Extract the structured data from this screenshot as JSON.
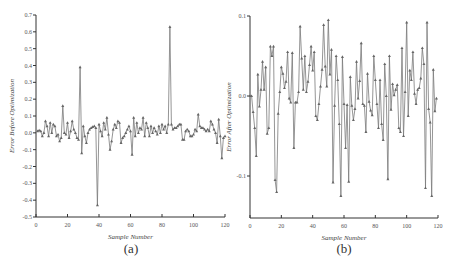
{
  "chart_data": [
    {
      "id": "a",
      "type": "line",
      "caption": "(a)",
      "title": "",
      "xlabel": "Sample Number",
      "ylabel": "Error Before Optimization",
      "xlim": [
        0,
        120
      ],
      "ylim": [
        -0.5,
        0.7
      ],
      "xticks": [
        0,
        20,
        40,
        60,
        80,
        100,
        120
      ],
      "yticks": [
        -0.5,
        -0.4,
        -0.3,
        -0.2,
        -0.1,
        0.0,
        0.1,
        0.2,
        0.3,
        0.4,
        0.5,
        0.6,
        0.7
      ],
      "ytick_labels": [
        "-0.5",
        "-0.4",
        "-0.3",
        "-0.2",
        "-0.1",
        "0.0",
        "0.1",
        "0.2",
        "0.3",
        "0.4",
        "0.5",
        "0.6",
        "0.7"
      ],
      "grid": false,
      "marker": "triangle",
      "x": [
        1,
        2,
        3,
        4,
        5,
        6,
        7,
        8,
        9,
        10,
        11,
        12,
        13,
        14,
        15,
        16,
        17,
        18,
        19,
        20,
        21,
        22,
        23,
        24,
        25,
        26,
        27,
        28,
        29,
        30,
        31,
        32,
        33,
        34,
        35,
        36,
        37,
        38,
        39,
        40,
        41,
        42,
        43,
        44,
        45,
        46,
        47,
        48,
        49,
        50,
        51,
        52,
        53,
        54,
        55,
        56,
        57,
        58,
        59,
        60,
        61,
        62,
        63,
        64,
        65,
        66,
        67,
        68,
        69,
        70,
        71,
        72,
        73,
        74,
        75,
        76,
        77,
        78,
        79,
        80,
        81,
        82,
        83,
        84,
        85,
        86,
        87,
        88,
        89,
        90,
        91,
        92,
        93,
        94,
        95,
        96,
        97,
        98,
        99,
        100,
        101,
        102,
        103,
        104,
        105,
        106,
        107,
        108,
        109,
        110,
        111,
        112,
        113,
        114,
        115,
        116,
        117,
        118,
        119,
        120
      ],
      "values": [
        0.01,
        0.015,
        0.01,
        -0.02,
        0.0,
        0.07,
        0.04,
        -0.02,
        0.06,
        0.0,
        0.05,
        0.04,
        -0.02,
        -0.01,
        -0.05,
        -0.03,
        0.16,
        0.0,
        -0.01,
        0.06,
        -0.03,
        0.01,
        0.07,
        0.02,
        0.0,
        -0.03,
        -0.04,
        0.39,
        -0.12,
        0.04,
        -0.02,
        -0.06,
        0.0,
        0.02,
        0.03,
        0.035,
        0.04,
        0.03,
        -0.43,
        0.05,
        0.01,
        -0.02,
        0.06,
        0.02,
        0.09,
        -0.01,
        -0.1,
        -0.05,
        0.02,
        0.05,
        0.03,
        0.07,
        0.06,
        -0.06,
        -0.03,
        -0.02,
        0.0,
        0.02,
        0.04,
        0.01,
        -0.13,
        0.09,
        -0.02,
        0.06,
        0.0,
        0.03,
        0.02,
        0.09,
        -0.02,
        0.06,
        0.03,
        -0.02,
        0.04,
        0.0,
        0.03,
        0.01,
        -0.01,
        0.04,
        0.0,
        0.05,
        0.02,
        0.04,
        0.0,
        0.05,
        0.63,
        0.05,
        0.02,
        0.03,
        0.03,
        0.04,
        0.05,
        0.05,
        -0.04,
        -0.04,
        0.01,
        0.02,
        0.01,
        -0.02,
        -0.02,
        -0.01,
        0.02,
        0.01,
        0.11,
        0.04,
        0.03,
        0.03,
        0.02,
        0.01,
        0.02,
        0.01,
        0.07,
        0.05,
        0.02,
        0.0,
        -0.06,
        0.08,
        -0.02,
        -0.15,
        -0.03,
        -0.02
      ]
    },
    {
      "id": "b",
      "type": "line",
      "caption": "(b)",
      "title": "",
      "xlabel": "Sample Number",
      "ylabel": "Error After Optimization",
      "xlim": [
        0,
        120
      ],
      "ylim": [
        -0.15,
        0.1
      ],
      "xticks": [
        0,
        20,
        40,
        60,
        80,
        100,
        120
      ],
      "yticks": [
        -0.1,
        0.0,
        0.1
      ],
      "ytick_labels": [
        "-0.1",
        "0.0",
        "0.1"
      ],
      "grid": false,
      "marker": "triangle",
      "x": [
        0,
        1,
        2,
        3,
        4,
        5,
        6,
        7,
        8,
        9,
        10,
        11,
        12,
        13,
        14,
        15,
        16,
        17,
        18,
        19,
        20,
        21,
        22,
        23,
        24,
        25,
        26,
        27,
        28,
        29,
        30,
        31,
        32,
        33,
        34,
        35,
        36,
        37,
        38,
        39,
        40,
        41,
        42,
        43,
        44,
        45,
        46,
        47,
        48,
        49,
        50,
        51,
        52,
        53,
        54,
        55,
        56,
        57,
        58,
        59,
        60,
        61,
        62,
        63,
        64,
        65,
        66,
        67,
        68,
        69,
        70,
        71,
        72,
        73,
        74,
        75,
        76,
        77,
        78,
        79,
        80,
        81,
        82,
        83,
        84,
        85,
        86,
        87,
        88,
        89,
        90,
        91,
        92,
        93,
        94,
        95,
        96,
        97,
        98,
        99,
        100,
        101,
        102,
        103,
        104,
        105,
        106,
        107,
        108,
        109,
        110,
        111,
        112,
        113,
        114,
        115,
        116,
        117,
        118,
        119
      ],
      "values": [
        0.0,
        0.0,
        -0.02,
        -0.04,
        -0.075,
        0.027,
        -0.013,
        0.008,
        0.043,
        0.008,
        0.036,
        -0.047,
        -0.04,
        0.062,
        0.05,
        0.062,
        -0.105,
        -0.12,
        -0.022,
        0.005,
        0.036,
        0.028,
        0.01,
        0.018,
        0.055,
        -0.003,
        -0.008,
        0.054,
        -0.065,
        -0.008,
        -0.008,
        0.005,
        0.087,
        0.047,
        0.008,
        0.05,
        0.005,
        0.018,
        0.039,
        0.062,
        0.032,
        0.055,
        -0.025,
        -0.03,
        -0.01,
        0.012,
        0.033,
        0.089,
        0.037,
        0.012,
        0.095,
        0.027,
        0.058,
        -0.108,
        -0.012,
        0.05,
        0.02,
        -0.035,
        -0.125,
        0.049,
        -0.01,
        -0.065,
        -0.011,
        -0.107,
        0.024,
        -0.012,
        -0.03,
        -0.016,
        0.043,
        -0.003,
        0.019,
        0.066,
        -0.01,
        -0.012,
        -0.045,
        0.028,
        -0.007,
        -0.018,
        -0.024,
        0.05,
        0.02,
        -0.01,
        -0.04,
        0.02,
        -0.035,
        -0.055,
        0.04,
        0.0,
        -0.104,
        0.05,
        -0.017,
        0.015,
        0.001,
        0.008,
        0.014,
        -0.04,
        -0.045,
        0.06,
        -0.05,
        0.005,
        0.092,
        -0.025,
        0.032,
        0.02,
        0.055,
        0.003,
        -0.01,
        0.008,
        0.01,
        0.022,
        0.06,
        0.04,
        -0.115,
        0.092,
        -0.016,
        -0.033,
        -0.125,
        0.033,
        -0.019,
        -0.003
      ]
    }
  ]
}
